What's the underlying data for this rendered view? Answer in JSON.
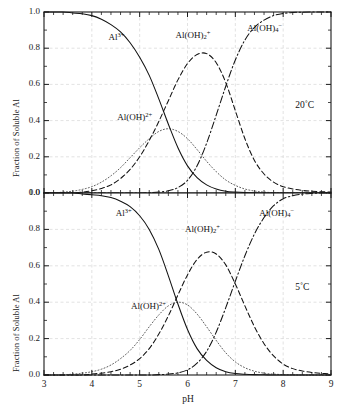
{
  "figure": {
    "width": 345,
    "height": 413,
    "background": "#ffffff",
    "axis_color": "#1a1a1a",
    "grid_color": "#cfcfcf"
  },
  "xaxis": {
    "title": "pH",
    "min": 3,
    "max": 9,
    "ticks": [
      3,
      4,
      5,
      6,
      7,
      8,
      9
    ],
    "tick_labels": [
      "3",
      "4",
      "5",
      "6",
      "7",
      "8",
      "9"
    ],
    "minor_ticks_per_interval": 5
  },
  "yaxis": {
    "title": "Fraction of Soluble Al",
    "min": 0.0,
    "max": 1.0,
    "ticks": [
      0.0,
      0.2,
      0.4,
      0.6,
      0.8,
      1.0
    ],
    "tick_labels": [
      "0.0",
      "0.2",
      "0.4",
      "0.6",
      "0.8",
      "1.0"
    ],
    "minor_ticks_per_interval": 2
  },
  "panels": [
    {
      "id": "top",
      "temperature_label": "20˚C",
      "yaxis_title": "Fraction of Soluble Al",
      "y_tick_labels": [
        "0.0",
        "0.2",
        "0.4",
        "0.6",
        "0.8",
        "1.0"
      ],
      "annotations": [
        {
          "id": "al3",
          "html": "Al<sup>3+</sup>",
          "x": 4.35,
          "y": 0.855
        },
        {
          "id": "aloh2plus",
          "html": "Al(OH)<sup>2+</sup>",
          "x": 4.53,
          "y": 0.415
        },
        {
          "id": "aloh2_plus",
          "html": "Al(OH)<sub>2</sub><sup>+</sup>",
          "x": 5.75,
          "y": 0.865
        },
        {
          "id": "aloh4",
          "html": "Al(OH)<sub>4</sub><sup>−</sup>",
          "x": 7.25,
          "y": 0.905
        }
      ]
    },
    {
      "id": "bottom",
      "temperature_label": "5˚C",
      "yaxis_title": "Fraction of Soluble Al",
      "y_tick_labels": [
        "0.0",
        "0.2",
        "0.4",
        "0.6",
        "0.8",
        "1.0"
      ],
      "annotations": [
        {
          "id": "al3",
          "html": "Al<sup>3+</sup>",
          "x": 4.5,
          "y": 0.885
        },
        {
          "id": "aloh2plus",
          "html": "Al(OH)<sup>2+</sup>",
          "x": 4.82,
          "y": 0.375
        },
        {
          "id": "aloh2_plus",
          "html": "Al(OH)<sub>2</sub><sup>+</sup>",
          "x": 5.95,
          "y": 0.795
        },
        {
          "id": "aloh4",
          "html": "Al(OH)<sub>4</sub><sup>−</sup>",
          "x": 7.5,
          "y": 0.885
        }
      ]
    }
  ],
  "chart_data": {
    "type": "line",
    "title": "",
    "xlabel": "pH",
    "ylabel": "Fraction of Soluble Al",
    "xlim": [
      3,
      9
    ],
    "ylim": [
      0.0,
      1.0
    ],
    "grid": true,
    "legend": "inline-annotations",
    "panels": [
      {
        "name": "20˚C",
        "annotation": "20˚C",
        "x": [
          3.0,
          3.2,
          3.4,
          3.6,
          3.8,
          4.0,
          4.2,
          4.4,
          4.6,
          4.8,
          5.0,
          5.2,
          5.4,
          5.6,
          5.8,
          6.0,
          6.2,
          6.4,
          6.6,
          6.8,
          7.0,
          7.2,
          7.4,
          7.6,
          7.8,
          8.0,
          8.2,
          8.4,
          8.6,
          8.8,
          9.0
        ],
        "series": [
          {
            "name": "Al3+",
            "label": "Al³⁺",
            "style": "solid",
            "values": [
              1.0,
              1.0,
              1.0,
              0.995,
              0.99,
              0.98,
              0.96,
              0.93,
              0.89,
              0.83,
              0.75,
              0.65,
              0.52,
              0.38,
              0.25,
              0.15,
              0.085,
              0.045,
              0.022,
              0.01,
              0.005,
              0.002,
              0.001,
              0.0,
              0.0,
              0.0,
              0.0,
              0.0,
              0.0,
              0.0,
              0.0
            ]
          },
          {
            "name": "Al(OH)2+",
            "label": "Al(OH)²⁺",
            "style": "dotted",
            "peak_x": 5.6,
            "peak_y": 0.355,
            "values": [
              0.0,
              0.0,
              0.005,
              0.01,
              0.02,
              0.035,
              0.06,
              0.095,
              0.14,
              0.195,
              0.25,
              0.3,
              0.34,
              0.355,
              0.34,
              0.3,
              0.24,
              0.175,
              0.118,
              0.072,
              0.042,
              0.022,
              0.011,
              0.005,
              0.002,
              0.001,
              0.0,
              0.0,
              0.0,
              0.0,
              0.0
            ]
          },
          {
            "name": "Al(OH)2+ (dihydroxy)",
            "label": "Al(OH)₂⁺",
            "style": "dashed",
            "peak_x": 6.3,
            "peak_y": 0.77,
            "values": [
              0.0,
              0.0,
              0.0,
              0.0,
              0.005,
              0.012,
              0.025,
              0.045,
              0.08,
              0.13,
              0.2,
              0.29,
              0.395,
              0.51,
              0.625,
              0.715,
              0.765,
              0.77,
              0.72,
              0.61,
              0.455,
              0.3,
              0.18,
              0.105,
              0.06,
              0.035,
              0.022,
              0.014,
              0.01,
              0.007,
              0.005
            ]
          },
          {
            "name": "Al(OH)4-",
            "label": "Al(OH)₄⁻",
            "style": "dashdot",
            "values": [
              0.0,
              0.0,
              0.0,
              0.0,
              0.0,
              0.0,
              0.0,
              0.0,
              0.0,
              0.0,
              0.0,
              0.002,
              0.005,
              0.012,
              0.03,
              0.07,
              0.15,
              0.275,
              0.43,
              0.59,
              0.735,
              0.845,
              0.915,
              0.955,
              0.98,
              0.992,
              0.997,
              0.999,
              1.0,
              1.0,
              1.0
            ]
          }
        ]
      },
      {
        "name": "5˚C",
        "annotation": "5˚C",
        "x": [
          3.0,
          3.2,
          3.4,
          3.6,
          3.8,
          4.0,
          4.2,
          4.4,
          4.6,
          4.8,
          5.0,
          5.2,
          5.4,
          5.6,
          5.8,
          6.0,
          6.2,
          6.4,
          6.6,
          6.8,
          7.0,
          7.2,
          7.4,
          7.6,
          7.8,
          8.0,
          8.2,
          8.4,
          8.6,
          8.8,
          9.0
        ],
        "series": [
          {
            "name": "Al3+",
            "label": "Al³⁺",
            "style": "solid",
            "values": [
              1.0,
              1.0,
              1.0,
              1.0,
              0.995,
              0.99,
              0.985,
              0.975,
              0.955,
              0.925,
              0.875,
              0.8,
              0.69,
              0.545,
              0.39,
              0.25,
              0.145,
              0.08,
              0.04,
              0.018,
              0.008,
              0.004,
              0.002,
              0.001,
              0.0,
              0.0,
              0.0,
              0.0,
              0.0,
              0.0,
              0.0
            ]
          },
          {
            "name": "Al(OH)2+",
            "label": "Al(OH)²⁺",
            "style": "dotted",
            "peak_x": 5.8,
            "peak_y": 0.4,
            "values": [
              0.0,
              0.0,
              0.0,
              0.005,
              0.01,
              0.018,
              0.032,
              0.055,
              0.09,
              0.135,
              0.195,
              0.265,
              0.33,
              0.38,
              0.4,
              0.385,
              0.335,
              0.265,
              0.19,
              0.122,
              0.072,
              0.04,
              0.021,
              0.01,
              0.005,
              0.002,
              0.001,
              0.0,
              0.0,
              0.0,
              0.0
            ]
          },
          {
            "name": "Al(OH)2+ (dihydroxy)",
            "label": "Al(OH)₂⁺",
            "style": "dashed",
            "peak_x": 6.5,
            "peak_y": 0.68,
            "values": [
              0.0,
              0.0,
              0.0,
              0.0,
              0.0,
              0.005,
              0.01,
              0.018,
              0.032,
              0.055,
              0.09,
              0.145,
              0.225,
              0.325,
              0.44,
              0.55,
              0.635,
              0.675,
              0.665,
              0.605,
              0.5,
              0.38,
              0.265,
              0.172,
              0.105,
              0.06,
              0.035,
              0.022,
              0.014,
              0.009,
              0.006
            ]
          },
          {
            "name": "Al(OH)4-",
            "label": "Al(OH)₄⁻",
            "style": "dashdot",
            "values": [
              0.0,
              0.0,
              0.0,
              0.0,
              0.0,
              0.0,
              0.0,
              0.0,
              0.0,
              0.0,
              0.0,
              0.0,
              0.002,
              0.005,
              0.012,
              0.028,
              0.065,
              0.13,
              0.235,
              0.37,
              0.515,
              0.655,
              0.775,
              0.865,
              0.93,
              0.968,
              0.985,
              0.994,
              0.998,
              1.0,
              1.0
            ]
          }
        ]
      }
    ]
  }
}
